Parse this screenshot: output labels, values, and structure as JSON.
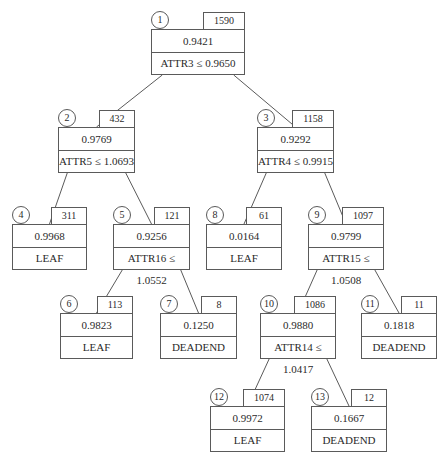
{
  "header": {
    "text": "",
    "page": ""
  },
  "tree": {
    "nodes": [
      {
        "id": "1",
        "count": "1590",
        "value": "0.9421",
        "rule": "ATTR3 ≤ 0.9650",
        "x": 151,
        "y": 29,
        "w": 94
      },
      {
        "id": "2",
        "count": "432",
        "value": "0.9769",
        "rule": "ATTR5 ≤ 1.0693",
        "x": 58,
        "y": 127,
        "w": 77
      },
      {
        "id": "3",
        "count": "1158",
        "value": "0.9292",
        "rule": "ATTR4 ≤ 0.9915",
        "x": 257,
        "y": 127,
        "w": 77
      },
      {
        "id": "4",
        "count": "311",
        "value": "0.9968",
        "rule": "LEAF",
        "x": 12,
        "y": 224,
        "w": 75
      },
      {
        "id": "5",
        "count": "121",
        "value": "0.9256",
        "rule": "ATTR16 ≤ 1.0552",
        "x": 113,
        "y": 224,
        "w": 77
      },
      {
        "id": "8",
        "count": "61",
        "value": "0.0164",
        "rule": "LEAF",
        "x": 206,
        "y": 224,
        "w": 76
      },
      {
        "id": "9",
        "count": "1097",
        "value": "0.9799",
        "rule": "ATTR15 ≤ 1.0508",
        "x": 308,
        "y": 224,
        "w": 76
      },
      {
        "id": "6",
        "count": "113",
        "value": "0.9823",
        "rule": "LEAF",
        "x": 60,
        "y": 313,
        "w": 73
      },
      {
        "id": "7",
        "count": "8",
        "value": "0.1250",
        "rule": "DEADEND",
        "x": 160,
        "y": 313,
        "w": 77
      },
      {
        "id": "10",
        "count": "1086",
        "value": "0.9880",
        "rule": "ATTR14 ≤ 1.0417",
        "x": 260,
        "y": 313,
        "w": 76
      },
      {
        "id": "11",
        "count": "11",
        "value": "0.1818",
        "rule": "DEADEND",
        "x": 361,
        "y": 313,
        "w": 76
      },
      {
        "id": "12",
        "count": "1074",
        "value": "0.9972",
        "rule": "LEAF",
        "x": 210,
        "y": 406,
        "w": 75
      },
      {
        "id": "13",
        "count": "12",
        "value": "0.1667",
        "rule": "DEADEND",
        "x": 311,
        "y": 406,
        "w": 76
      }
    ],
    "edges": [
      [
        "1",
        "2"
      ],
      [
        "1",
        "3"
      ],
      [
        "2",
        "4"
      ],
      [
        "2",
        "5"
      ],
      [
        "3",
        "8"
      ],
      [
        "3",
        "9"
      ],
      [
        "5",
        "6"
      ],
      [
        "5",
        "7"
      ],
      [
        "9",
        "10"
      ],
      [
        "9",
        "11"
      ],
      [
        "10",
        "12"
      ],
      [
        "10",
        "13"
      ]
    ],
    "colors": {
      "line": "#5a5a5a",
      "text": "#2a2a2a"
    }
  }
}
